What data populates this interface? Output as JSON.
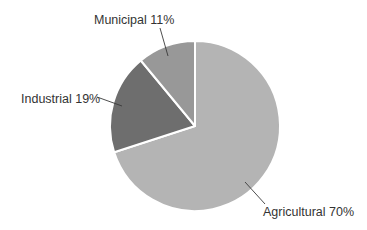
{
  "chart_data": {
    "type": "pie",
    "title": "",
    "start_angle_deg": 0,
    "direction": "clockwise",
    "center": [
      195,
      126
    ],
    "radius": 85,
    "slices": [
      {
        "name": "Agricultural",
        "value": 70,
        "label": "Agricultural 70%",
        "color": "#b4b4b4",
        "label_pos": [
          263,
          216
        ],
        "label_anchor": "start",
        "leader": [
          [
            245,
            182
          ],
          [
            265,
            204
          ]
        ]
      },
      {
        "name": "Industrial",
        "value": 19,
        "label": "Industrial 19%",
        "color": "#6e6e6e",
        "label_pos": [
          21,
          103
        ],
        "label_anchor": "start",
        "leader": [
          [
            97,
            97
          ],
          [
            122,
            106
          ]
        ]
      },
      {
        "name": "Municipal",
        "value": 11,
        "label": "Municipal 11%",
        "color": "#989898",
        "label_pos": [
          94,
          24
        ],
        "label_anchor": "start",
        "leader": [
          [
            160,
            28
          ],
          [
            168,
            56
          ]
        ]
      }
    ],
    "legend": "none (labels on slices)"
  }
}
